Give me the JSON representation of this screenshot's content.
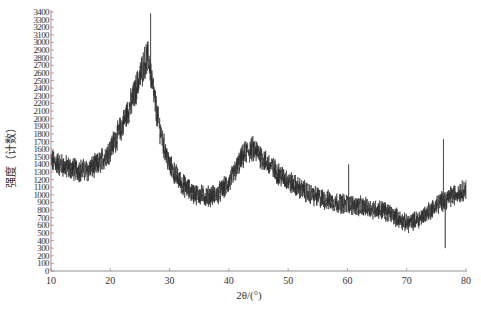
{
  "chart_data": {
    "type": "line",
    "title": "",
    "xlabel": "2θ/(°)",
    "ylabel": "强度（计数）",
    "xlim": [
      10,
      80
    ],
    "ylim": [
      0,
      3400
    ],
    "x_ticks": [
      10,
      20,
      30,
      40,
      50,
      60,
      70,
      80
    ],
    "y_ticks": [
      0,
      100,
      200,
      300,
      400,
      500,
      600,
      700,
      800,
      900,
      1000,
      1100,
      1200,
      1300,
      1400,
      1500,
      1600,
      1700,
      1800,
      1900,
      2000,
      2100,
      2200,
      2300,
      2400,
      2500,
      2600,
      2700,
      2800,
      2900,
      3000,
      3100,
      3200,
      3300,
      3400
    ],
    "grid": false,
    "legend": null,
    "line_color": "#2a2a2a",
    "series": [
      {
        "name": "XRD pattern",
        "description": "Noisy diffraction trace (envelope centerline, counts); broad peaks near 2θ≈26° (~2800) and ≈44° (~1600)",
        "x": [
          10,
          12,
          14,
          16,
          18,
          20,
          22,
          24,
          25,
          26,
          26.5,
          27,
          28,
          29,
          30,
          32,
          34,
          36,
          38,
          40,
          42,
          43,
          44,
          45,
          46,
          48,
          50,
          52,
          54,
          56,
          58,
          60,
          62,
          64,
          66,
          68,
          70,
          72,
          74,
          76,
          78,
          80
        ],
        "values": [
          1450,
          1380,
          1330,
          1320,
          1400,
          1600,
          1900,
          2300,
          2550,
          2780,
          2800,
          2500,
          2000,
          1650,
          1380,
          1150,
          1020,
          980,
          1000,
          1150,
          1450,
          1570,
          1600,
          1550,
          1450,
          1300,
          1180,
          1080,
          1000,
          940,
          900,
          880,
          850,
          820,
          800,
          720,
          620,
          680,
          800,
          920,
          1000,
          1080
        ],
        "noise_amplitude": 130,
        "notable_spikes": [
          {
            "x": 26.8,
            "y": 3380
          },
          {
            "x": 60.2,
            "y": 1400
          },
          {
            "x": 76.2,
            "y": 1730
          },
          {
            "x": 76.5,
            "y": 300
          }
        ]
      }
    ]
  }
}
